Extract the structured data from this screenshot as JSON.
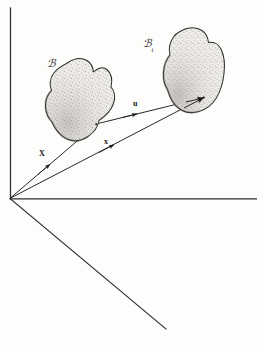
{
  "figure": {
    "kind": "continuum-mechanics-configuration-diagram",
    "width": 257,
    "height": 345,
    "background_color": "#fdfdfc",
    "ink_color": "#1a1a1a"
  },
  "axes": {
    "origin_label": "",
    "vertical_axis_name": "vertical-axis",
    "horizontal_axis_name": "horizontal-axis",
    "depth_axis_name": "depth-axis"
  },
  "bodies": [
    {
      "id": "reference-configuration",
      "label_main": "ℬ",
      "label_sub": "",
      "fill_color": "#e8e6e2",
      "edge_color": "#2b2b2b"
    },
    {
      "id": "current-configuration",
      "label_main": "ℬ",
      "label_sub": "t",
      "fill_color": "#e8e6e2",
      "edge_color": "#2b2b2b"
    }
  ],
  "vectors": [
    {
      "id": "reference-position-vector",
      "label": "X",
      "description": "material position vector"
    },
    {
      "id": "current-position-vector",
      "label": "x",
      "description": "spatial position vector"
    },
    {
      "id": "displacement-vector",
      "label": "u",
      "description": "displacement vector"
    }
  ],
  "labels": {
    "reference_body": "ℬ",
    "current_body": "ℬ",
    "current_body_sub": "t",
    "vec_X": "X",
    "vec_x": "x",
    "vec_u": "u"
  }
}
